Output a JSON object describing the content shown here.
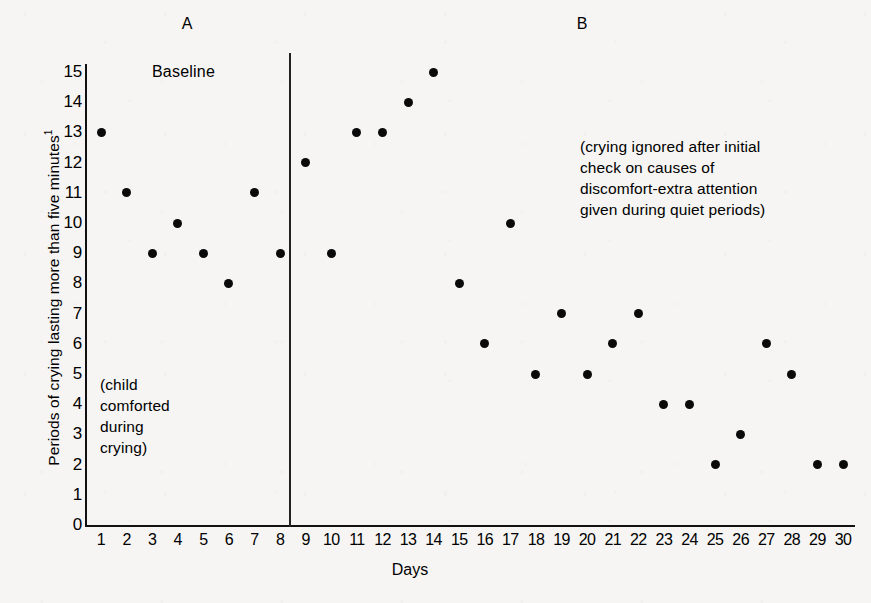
{
  "figure": {
    "panel_labels": {
      "a": "A",
      "b": "B"
    },
    "baseline_label": "Baseline",
    "annotation_left": "(child\ncomforted\nduring\ncrying)",
    "annotation_right": "(crying ignored after initial\ncheck on causes of\ndiscomfort-extra attention\ngiven during quiet periods)",
    "dot_color": "#0a0a0a",
    "axis_color": "#111111",
    "background_color": "#f6f5f3"
  },
  "chart_data": {
    "type": "scatter",
    "title": "",
    "xlabel": "Days",
    "ylabel": "Periods of crying lasting more than five minutes",
    "ylabel_superscript": "1",
    "xlim": [
      0,
      31
    ],
    "ylim": [
      0,
      15
    ],
    "grid": false,
    "legend": "none",
    "yticks": [
      "15",
      "14",
      "13",
      "12",
      "11",
      "10",
      "9",
      "8",
      "7",
      "6",
      "5",
      "4",
      "3",
      "2",
      "1",
      "0"
    ],
    "ytick_values": [
      15,
      14,
      13,
      12,
      11,
      10,
      9,
      8,
      7,
      6,
      5,
      4,
      3,
      2,
      1,
      0
    ],
    "xticks": [
      "1",
      "2",
      "3",
      "4",
      "5",
      "6",
      "7",
      "8",
      "9",
      "10",
      "11",
      "12",
      "13",
      "14",
      "15",
      "16",
      "17",
      "18",
      "19",
      "20",
      "21",
      "22",
      "23",
      "24",
      "25",
      "26",
      "27",
      "28",
      "29",
      "30"
    ],
    "x": [
      1,
      2,
      3,
      4,
      5,
      6,
      7,
      8,
      9,
      10,
      11,
      12,
      13,
      14,
      15,
      16,
      17,
      18,
      19,
      20,
      21,
      22,
      23,
      24,
      25,
      26,
      27,
      28,
      29,
      30
    ],
    "values": [
      13,
      11,
      9,
      10,
      9,
      8,
      11,
      9,
      12,
      9,
      13,
      13,
      14,
      15,
      8,
      6,
      10,
      5,
      7,
      5,
      6,
      7,
      4,
      4,
      2,
      3,
      6,
      5,
      2,
      2
    ],
    "phases": [
      {
        "name": "A",
        "label": "Baseline",
        "days": [
          1,
          8
        ],
        "note": "(child comforted during crying)"
      },
      {
        "name": "B",
        "label": "",
        "days": [
          9,
          30
        ],
        "note": "(crying ignored after initial check on causes of discomfort-extra attention given during quiet periods)"
      }
    ],
    "phase_divider_after_day": 8
  }
}
